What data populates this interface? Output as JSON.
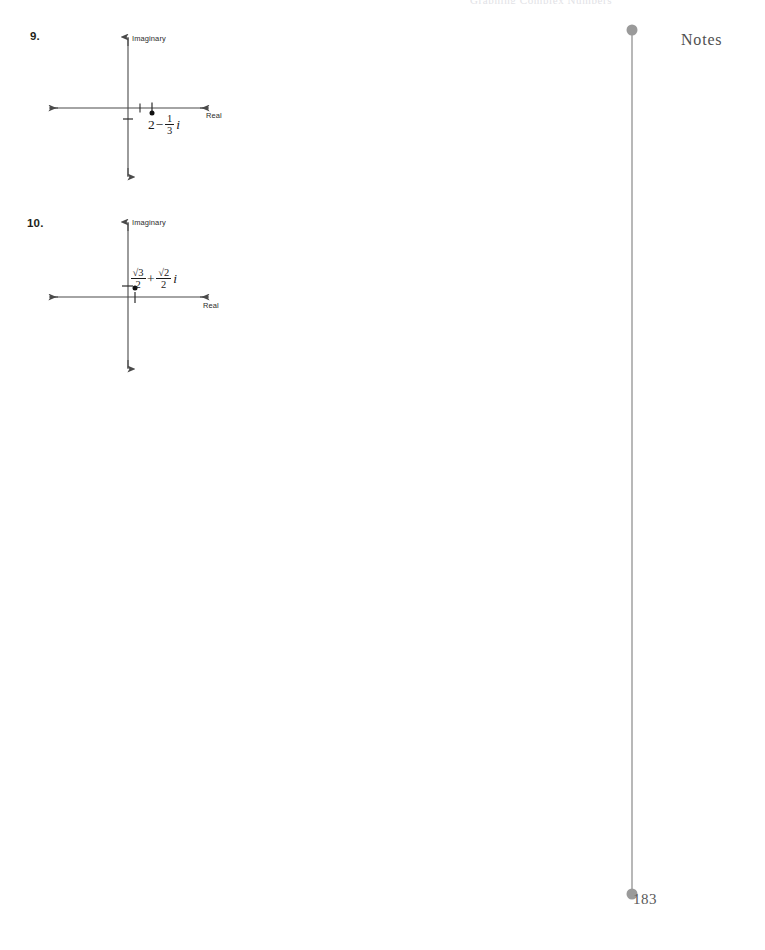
{
  "page": {
    "running_head": "Graphing Complex Numbers",
    "page_number": "183",
    "background_color": "#ffffff",
    "ink_color": "#231f20",
    "spine_color": "#9a9a9a"
  },
  "sidebar": {
    "notes_label": "Notes"
  },
  "problems": [
    {
      "number": "9.",
      "diagram": {
        "imaginary_axis_label": "Imaginary",
        "real_axis_label": "Real",
        "point_label_parts": {
          "real_part": "2",
          "operator": "−",
          "fraction_numerator": "1",
          "fraction_denominator": "3",
          "imaginary_unit": "i"
        },
        "point_label_plain": "2 − 1/3 i",
        "point": {
          "real": 2,
          "imaginary": -0.3333
        },
        "ticks_real": [
          1,
          2
        ],
        "ticks_imaginary": [
          -0.3333
        ]
      }
    },
    {
      "number": "10.",
      "diagram": {
        "imaginary_axis_label": "Imaginary",
        "real_axis_label": "Real",
        "point_label_parts": {
          "first_numerator": "√3",
          "first_denominator": "2",
          "operator": "+",
          "second_numerator": "√2",
          "second_denominator": "2",
          "imaginary_unit": "i"
        },
        "point_label_plain": "√3/2 + √2/2 i",
        "point": {
          "real": 0.866,
          "imaginary": 0.707
        },
        "ticks_real": [
          0.866
        ],
        "ticks_imaginary": [
          0.707
        ]
      }
    }
  ]
}
